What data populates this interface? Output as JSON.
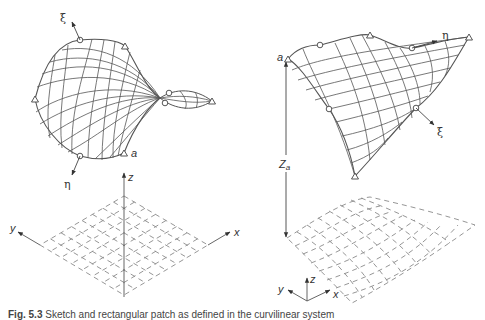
{
  "figure": {
    "caption_label": "Fig. 5.3",
    "caption_text": "Sketch and rectangular patch as defined in the curvilinear system",
    "left_panel": {
      "labels": {
        "xi": "ξ",
        "eta": "η",
        "a": "a",
        "x": "x",
        "y": "y",
        "z": "z"
      },
      "control_points": {
        "circles": [
          [
            80,
            40
          ],
          [
            80,
            156
          ],
          [
            169,
            93
          ],
          [
            165,
            103
          ]
        ],
        "triangles": [
          [
            125,
            46
          ],
          [
            35,
            99
          ],
          [
            124,
            153
          ],
          [
            212,
            101
          ]
        ]
      }
    },
    "right_panel": {
      "labels": {
        "xi": "ξ",
        "eta": "η",
        "a": "a",
        "Z": "Z",
        "Z_sub": "a",
        "x": "x",
        "y": "y",
        "z": "z"
      },
      "control_points": {
        "circles": [
          [
            320,
            45
          ],
          [
            412,
            48
          ],
          [
            329,
            109
          ],
          [
            416,
            108
          ]
        ],
        "triangles": [
          [
            288,
            59
          ],
          [
            370,
            35
          ],
          [
            469,
            37
          ],
          [
            355,
            176
          ]
        ]
      }
    },
    "colors": {
      "line": "#555555",
      "grid": "#777777",
      "dashed": "#888888"
    }
  }
}
